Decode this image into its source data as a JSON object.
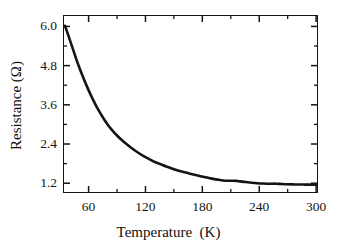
{
  "chart_data": {
    "type": "line",
    "title": "",
    "xlabel": "Temperature  (K)",
    "ylabel": "Resistance (Ω)",
    "xlim": [
      33,
      302
    ],
    "ylim": [
      0.9,
      6.35
    ],
    "grid": false,
    "legend": null,
    "x_major_ticks": [
      60,
      120,
      180,
      240,
      300
    ],
    "x_major_ticklabels": [
      "60",
      "120",
      "180",
      "240",
      "300"
    ],
    "x_minor_ticks": [
      90,
      150,
      210,
      270
    ],
    "y_major_ticks": [
      1.2,
      2.4,
      3.6,
      4.8,
      6.0
    ],
    "y_major_ticklabels": [
      "1.2",
      "2.4",
      "3.6",
      "4.8",
      "6.0"
    ],
    "y_minor_ticks": [
      1.8,
      3.0,
      4.2,
      5.4
    ],
    "series": [
      {
        "name": "Resistance",
        "color": "#141414",
        "linewidth": 2.6,
        "x": [
          35,
          38,
          41,
          44,
          47,
          50,
          54,
          58,
          62,
          66,
          70,
          75,
          80,
          85,
          90,
          95,
          100,
          106,
          112,
          118,
          124,
          130,
          136,
          142,
          150,
          158,
          166,
          174,
          182,
          190,
          196,
          202,
          208,
          212,
          216,
          220,
          226,
          232,
          238,
          244,
          248,
          252,
          258,
          264,
          270,
          278,
          286,
          294,
          300
        ],
        "y": [
          6.02,
          5.78,
          5.52,
          5.26,
          5.0,
          4.76,
          4.46,
          4.18,
          3.92,
          3.68,
          3.46,
          3.22,
          3.0,
          2.82,
          2.66,
          2.52,
          2.4,
          2.26,
          2.14,
          2.03,
          1.94,
          1.85,
          1.78,
          1.71,
          1.63,
          1.56,
          1.5,
          1.44,
          1.39,
          1.34,
          1.31,
          1.285,
          1.275,
          1.275,
          1.27,
          1.255,
          1.235,
          1.215,
          1.2,
          1.19,
          1.185,
          1.185,
          1.185,
          1.175,
          1.168,
          1.162,
          1.158,
          1.156,
          1.155
        ]
      }
    ]
  },
  "axis": {
    "x_title": "Temperature  (K)",
    "y_title": "Resistance (Ω)"
  }
}
